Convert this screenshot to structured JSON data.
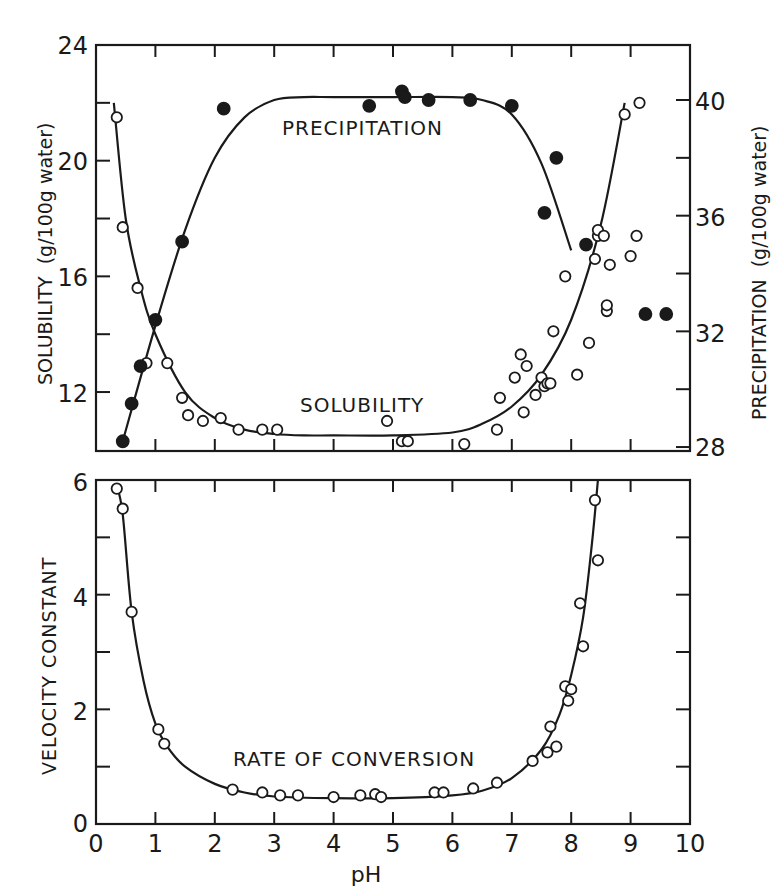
{
  "figure": {
    "top_panel": {
      "left_axis_label": "SOLUBILITY  (g/100g water)",
      "right_axis_label": "PRECIPITATION  (g/100g water)",
      "left_ticks": [
        "24",
        "20",
        "16",
        "12"
      ],
      "right_ticks": [
        "40",
        "36",
        "32",
        "28"
      ],
      "annotation_precipitation": "PRECIPITATION",
      "annotation_solubility": "SOLUBILITY"
    },
    "bottom_panel": {
      "left_axis_label": "VELOCITY CONSTANT",
      "left_ticks": [
        "6",
        "4",
        "2",
        "0"
      ],
      "annotation_rate": "RATE OF CONVERSION"
    },
    "x_ticks": [
      "0",
      "1",
      "2",
      "3",
      "4",
      "5",
      "6",
      "7",
      "8",
      "9",
      "10"
    ],
    "x_label": "pH"
  },
  "chart_data": [
    {
      "type": "scatter",
      "title": "",
      "panel": "top",
      "xlabel": "",
      "ylabel": "SOLUBILITY (g/100g water)",
      "y2label": "PRECIPITATION (g/100g water)",
      "xlim": [
        0,
        10
      ],
      "ylim": [
        10,
        24
      ],
      "y2lim": [
        28,
        42
      ],
      "grid": false,
      "legend": "inline annotations",
      "series": [
        {
          "name": "Solubility (open circles, left axis)",
          "marker": "open-circle",
          "x": [
            0.35,
            0.45,
            0.7,
            0.85,
            1.2,
            1.45,
            1.55,
            1.8,
            2.1,
            2.4,
            2.8,
            3.05,
            4.9,
            5.15,
            5.25,
            6.2,
            6.75,
            6.8,
            7.05,
            7.15,
            7.2,
            7.25,
            7.4,
            7.5,
            7.55,
            7.6,
            7.65,
            7.7,
            7.9,
            8.1,
            8.3,
            8.4,
            8.45,
            8.45,
            8.6,
            8.6,
            8.65,
            8.55,
            8.9,
            9.0,
            9.1,
            9.15
          ],
          "y": [
            21.5,
            17.7,
            15.6,
            13.0,
            13.0,
            11.8,
            11.2,
            11.0,
            11.1,
            10.7,
            10.7,
            10.7,
            11.0,
            10.3,
            10.3,
            10.2,
            10.7,
            11.8,
            12.5,
            13.3,
            11.3,
            12.9,
            11.9,
            12.5,
            12.2,
            12.3,
            12.3,
            14.1,
            16.0,
            12.6,
            13.7,
            16.6,
            17.4,
            17.6,
            14.8,
            15.0,
            16.4,
            17.4,
            21.6,
            16.7,
            17.4,
            22.0
          ]
        },
        {
          "name": "Solubility fit",
          "type": "line",
          "x": [
            0.3,
            0.5,
            0.75,
            1.0,
            1.5,
            2.0,
            2.5,
            3.0,
            3.5,
            4.0,
            5.0,
            6.0,
            6.5,
            7.0,
            7.5,
            8.0,
            8.5,
            8.9
          ],
          "y": [
            22.0,
            18.0,
            15.6,
            14.0,
            12.0,
            11.1,
            10.7,
            10.55,
            10.5,
            10.5,
            10.5,
            10.6,
            10.9,
            11.5,
            12.6,
            14.5,
            17.8,
            22.0
          ]
        },
        {
          "name": "Precipitation (filled circles, right axis)",
          "marker": "filled-circle",
          "axis": "right",
          "x": [
            0.45,
            0.6,
            0.75,
            1.0,
            1.45,
            2.15,
            4.6,
            5.15,
            5.2,
            5.6,
            6.3,
            7.0,
            7.75,
            7.55,
            8.25,
            9.25,
            9.6
          ],
          "y": [
            28.2,
            29.5,
            30.8,
            32.4,
            35.1,
            39.7,
            39.8,
            40.3,
            40.1,
            40.0,
            40.0,
            39.8,
            38.0,
            36.1,
            35.0,
            32.6,
            32.6
          ]
        },
        {
          "name": "Precipitation fit",
          "type": "line",
          "axis": "right",
          "x": [
            0.45,
            1.0,
            1.5,
            2.0,
            2.5,
            3.0,
            3.5,
            4.0,
            5.0,
            6.0,
            6.5,
            7.0,
            7.5,
            8.0
          ],
          "y": [
            28.2,
            32.2,
            35.5,
            38.0,
            39.4,
            40.0,
            40.1,
            40.1,
            40.1,
            40.1,
            40.0,
            39.5,
            37.8,
            34.8
          ]
        }
      ]
    },
    {
      "type": "scatter",
      "title": "",
      "panel": "bottom",
      "xlabel": "pH",
      "ylabel": "VELOCITY CONSTANT",
      "xlim": [
        0,
        10
      ],
      "ylim": [
        0,
        6
      ],
      "grid": false,
      "legend": "inline annotation",
      "series": [
        {
          "name": "Rate of conversion (open circles)",
          "marker": "open-circle",
          "x": [
            0.35,
            0.45,
            0.6,
            1.05,
            1.15,
            2.3,
            2.8,
            3.1,
            3.4,
            4.0,
            4.45,
            4.7,
            4.8,
            5.7,
            5.85,
            6.35,
            6.75,
            7.35,
            7.6,
            7.65,
            7.75,
            7.9,
            7.95,
            8.0,
            8.15,
            8.2,
            8.4,
            8.45
          ],
          "y": [
            5.85,
            5.5,
            3.7,
            1.65,
            1.4,
            0.6,
            0.55,
            0.5,
            0.5,
            0.47,
            0.5,
            0.52,
            0.47,
            0.55,
            0.55,
            0.62,
            0.72,
            1.1,
            1.25,
            1.7,
            1.35,
            2.4,
            2.15,
            2.35,
            3.85,
            3.1,
            5.65,
            4.6
          ]
        },
        {
          "name": "Rate fit",
          "type": "line",
          "x": [
            0.35,
            0.45,
            0.6,
            0.8,
            1.0,
            1.2,
            1.5,
            2.0,
            2.5,
            3.0,
            4.0,
            5.0,
            6.0,
            6.5,
            7.0,
            7.5,
            7.8,
            8.0,
            8.2,
            8.35,
            8.45
          ],
          "y": [
            5.9,
            5.4,
            3.7,
            2.5,
            1.75,
            1.35,
            1.0,
            0.7,
            0.55,
            0.48,
            0.45,
            0.45,
            0.5,
            0.58,
            0.8,
            1.3,
            1.9,
            2.6,
            3.6,
            4.9,
            6.0
          ]
        }
      ]
    }
  ]
}
